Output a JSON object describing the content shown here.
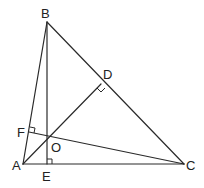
{
  "figure": {
    "type": "triangle-altitudes-orthocenter",
    "points": {
      "A": {
        "label": "A",
        "x": 23,
        "y": 164,
        "label_x": 12,
        "label_y": 170
      },
      "B": {
        "label": "B",
        "x": 47,
        "y": 22,
        "label_x": 41,
        "label_y": 18
      },
      "C": {
        "label": "C",
        "x": 184,
        "y": 164,
        "label_x": 186,
        "label_y": 170
      },
      "D": {
        "label": "D",
        "x": 101,
        "y": 84,
        "label_x": 103,
        "label_y": 79
      },
      "E": {
        "label": "E",
        "x": 47,
        "y": 164,
        "label_x": 42,
        "label_y": 181
      },
      "F": {
        "label": "F",
        "x": 29,
        "y": 132,
        "label_x": 17,
        "label_y": 137
      },
      "O": {
        "label": "O",
        "x": 47,
        "y": 138,
        "label_x": 51,
        "label_y": 152
      }
    },
    "segments": [
      {
        "from": "A",
        "to": "B"
      },
      {
        "from": "B",
        "to": "C"
      },
      {
        "from": "A",
        "to": "C"
      },
      {
        "from": "B",
        "to": "E"
      },
      {
        "from": "A",
        "to": "D"
      },
      {
        "from": "C",
        "to": "F"
      }
    ],
    "right_angles": [
      "D",
      "E",
      "F"
    ],
    "line_color": "#2a2a2a"
  }
}
